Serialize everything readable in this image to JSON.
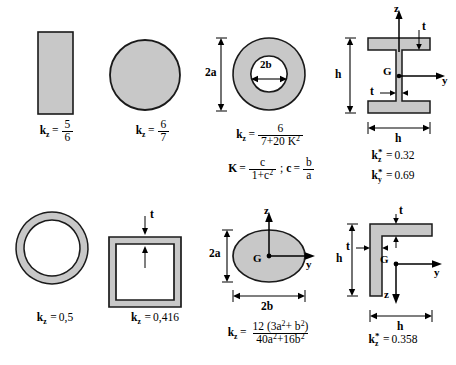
{
  "figure": {
    "colors": {
      "fill": "#c8c8c8",
      "outline": "#1a1a1a",
      "background": "#ffffff"
    }
  },
  "sections": [
    {
      "id": "rectangle",
      "shape": "solid-rectangle",
      "formula": {
        "k": "k",
        "sub": "z",
        "eq": "=",
        "numerator": "5",
        "denominator": "6"
      },
      "dimensions": []
    },
    {
      "id": "circle",
      "shape": "solid-circle",
      "formula": {
        "k": "k",
        "sub": "z",
        "eq": "=",
        "numerator": "6",
        "denominator": "7"
      },
      "dimensions": []
    },
    {
      "id": "hollow-circle",
      "shape": "annulus",
      "formula": {
        "k": "k",
        "sub": "z",
        "eq": "=",
        "numerator": "6",
        "denominator": "7+20 K",
        "den_sup": "2"
      },
      "aux_formula": {
        "lhs": "K",
        "eq": "=",
        "numerator": "c",
        "denominator": "1+c",
        "den_sup": "2",
        "separator": ";",
        "rhs_lhs": "c",
        "rhs_eq": "=",
        "rhs_num": "b",
        "rhs_den": "a"
      },
      "dimensions": [
        {
          "name": "outer-height",
          "label": "2a"
        },
        {
          "name": "inner-width",
          "label": "2b"
        }
      ]
    },
    {
      "id": "i-beam",
      "shape": "i-section",
      "results": [
        {
          "k": "k",
          "sub": "z",
          "star": "*",
          "eq": "=",
          "value": "0.32"
        },
        {
          "k": "k",
          "sub": "y",
          "star": "*",
          "eq": "=",
          "value": "0.69"
        }
      ],
      "dimensions": [
        {
          "name": "height",
          "label": "h"
        },
        {
          "name": "width",
          "label": "h"
        },
        {
          "name": "flange-thickness",
          "label": "t"
        },
        {
          "name": "web-thickness",
          "label": "t"
        }
      ],
      "axes": [
        {
          "name": "z-axis",
          "label": "z"
        },
        {
          "name": "y-axis",
          "label": "y"
        },
        {
          "name": "centroid",
          "label": "G"
        }
      ]
    },
    {
      "id": "hollow-circle-thin",
      "shape": "thin-ring",
      "formula_plain": {
        "k": "k",
        "sub": "z",
        "eq": "=",
        "value": "0,5"
      },
      "dimensions": []
    },
    {
      "id": "square-tube",
      "shape": "thin-square-tube",
      "formula_plain": {
        "k": "k",
        "sub": "z",
        "eq": "=",
        "value": "0,416"
      },
      "dimensions": [
        {
          "name": "wall-thickness",
          "label": "t"
        }
      ]
    },
    {
      "id": "ellipse",
      "shape": "solid-ellipse",
      "formula": {
        "k": "k",
        "sub": "z",
        "eq": "=",
        "num_lead": "12 (3a",
        "num_sup1": "2",
        "num_mid": "+ b",
        "num_sup2": "2",
        "num_tail": ")",
        "den_lead": "40a",
        "den_sup1": "2",
        "den_mid": "+16b",
        "den_sup2": "2"
      },
      "dimensions": [
        {
          "name": "semi-axis-vertical",
          "label": "2a"
        },
        {
          "name": "semi-axis-horizontal",
          "label": "2b"
        }
      ],
      "axes": [
        {
          "name": "z-axis",
          "label": "z"
        },
        {
          "name": "y-axis",
          "label": "y"
        },
        {
          "name": "centroid",
          "label": "G"
        }
      ]
    },
    {
      "id": "angle",
      "shape": "l-angle",
      "results": [
        {
          "k": "k",
          "sub": "z",
          "star": "*",
          "eq": "=",
          "value": "0.358"
        }
      ],
      "dimensions": [
        {
          "name": "height",
          "label": "h"
        },
        {
          "name": "width",
          "label": "h"
        },
        {
          "name": "flange-thickness",
          "label": "t"
        },
        {
          "name": "leg-thickness",
          "label": "t"
        }
      ],
      "axes": [
        {
          "name": "z-axis",
          "label": "z"
        },
        {
          "name": "y-axis",
          "label": "y"
        },
        {
          "name": "centroid",
          "label": "G"
        }
      ]
    }
  ]
}
